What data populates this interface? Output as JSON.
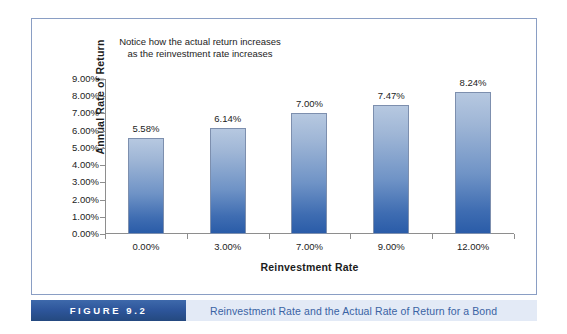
{
  "figure": {
    "number_label": "FIGURE 9.2",
    "caption": "Reinvestment Rate and the Actual Rate of Return for a Bond",
    "accent_dark_blue": "#2d559a",
    "caption_bg": "#e3eaf6",
    "caption_text_color": "#3a63a4",
    "frame_border_color": "#8a9ec4"
  },
  "annotation": {
    "text": "Notice how the actual return increases as the reinvestment rate increases"
  },
  "chart_data": {
    "type": "bar",
    "title": "",
    "subtitle": "",
    "xlabel": "Reinvestment Rate",
    "ylabel": "Annual Rate of Return",
    "categories": [
      "0.00%",
      "3.00%",
      "7.00%",
      "9.00%",
      "12.00%"
    ],
    "values": [
      5.58,
      6.14,
      7.0,
      7.47,
      8.24
    ],
    "value_labels": [
      "5.58%",
      "6.14%",
      "7.00%",
      "7.47%",
      "8.24%"
    ],
    "ylim": [
      0,
      9
    ],
    "ytick_values": [
      9,
      8,
      7,
      6,
      5,
      4,
      3,
      2,
      1,
      0
    ],
    "ytick_labels": [
      "9.00%",
      "8.00%",
      "7.00%",
      "6.00%",
      "5.00%",
      "4.00%",
      "3.00%",
      "2.00%",
      "1.00%",
      "0.00%"
    ],
    "grid": false,
    "legend": false,
    "legend_position": "none",
    "bar_gradient_top": "#b6c8e0",
    "bar_gradient_bottom": "#2a5ca8",
    "bar_border_color": "#7d8fae",
    "axis_color": "#8e8e8e",
    "series": [
      {
        "name": "Annual Rate of Return",
        "values": [
          5.58,
          6.14,
          7.0,
          7.47,
          8.24
        ]
      }
    ]
  }
}
